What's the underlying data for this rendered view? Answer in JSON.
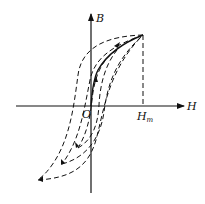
{
  "diagram": {
    "type": "magnetic hysteresis loops (B-H curve)",
    "axes": {
      "x_label": "H",
      "y_label": "B",
      "origin_label": "O"
    },
    "markers": {
      "h_max_label": "H",
      "h_max_subscript": "m"
    },
    "curves": [
      {
        "name": "initial magnetization curve",
        "style": "solid"
      },
      {
        "name": "hysteresis loop outer",
        "style": "dashed"
      },
      {
        "name": "hysteresis loop middle",
        "style": "dashed"
      },
      {
        "name": "hysteresis loop inner",
        "style": "dashed"
      }
    ],
    "colors": {
      "stroke": "#111111",
      "background": "#ffffff"
    }
  }
}
